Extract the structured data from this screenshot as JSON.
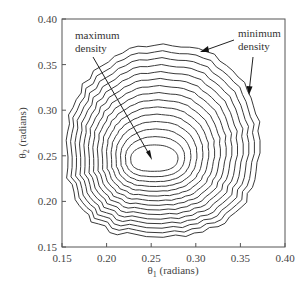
{
  "chart_data": {
    "type": "contour",
    "title": "",
    "xlabel": "θ1 (radians)",
    "ylabel": "θ2 (radians)",
    "xlabel_main": "θ",
    "xlabel_sub": "1",
    "xlabel_rest": " (radians)",
    "ylabel_main": "θ",
    "ylabel_sub": "2",
    "ylabel_rest": " (radians)",
    "xlim": [
      0.15,
      0.4
    ],
    "ylim": [
      0.15,
      0.4
    ],
    "xticks": [
      "0.15",
      "0.20",
      "0.25",
      "0.30",
      "0.35",
      "0.40"
    ],
    "yticks": [
      "0.15",
      "0.20",
      "0.25",
      "0.30",
      "0.35",
      "0.40"
    ],
    "grid": false,
    "num_contour_levels": 15,
    "peak": {
      "theta1": 0.25,
      "theta2": 0.245
    },
    "inner_contour_extent": {
      "theta1": [
        0.227,
        0.28
      ],
      "theta2": [
        0.233,
        0.262
      ]
    },
    "outer_contour_extent": {
      "theta1": [
        0.155,
        0.372
      ],
      "theta2": [
        0.161,
        0.373
      ]
    },
    "annotations": [
      {
        "text_lines": [
          "maximum",
          "density"
        ],
        "points_to": "innermost contour (max density)",
        "arrow_tip": {
          "theta1": 0.252,
          "theta2": 0.247
        }
      },
      {
        "text_lines": [
          "minimum",
          "density"
        ],
        "points_to": "outermost contour (min density)",
        "arrow_tips": [
          {
            "theta1": 0.305,
            "theta2": 0.363
          },
          {
            "theta1": 0.359,
            "theta2": 0.315
          }
        ]
      }
    ]
  },
  "annotations": {
    "max_line1": "maximum",
    "max_line2": "density",
    "min_line1": "minimum",
    "min_line2": "density"
  },
  "colors": {
    "contour": "#3a3a3a",
    "frame": "#555555",
    "text": "#444444"
  }
}
